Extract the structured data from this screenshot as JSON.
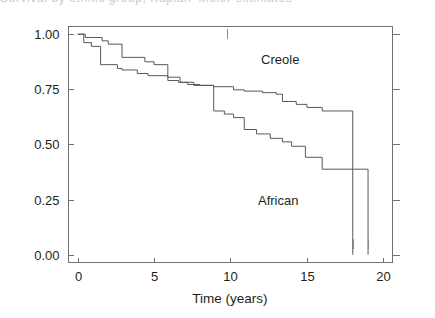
{
  "figure": {
    "width": 435,
    "height": 318,
    "background": "#ffffff",
    "clipped_caption_remnant": "Survival by ethnic group, Kaplan–Meier estimates"
  },
  "chart_data": {
    "type": "line",
    "subtype": "kaplan-meier-step",
    "title": "",
    "xlabel": "Time (years)",
    "ylabel": "",
    "xlim": [
      -0.6,
      20.6
    ],
    "ylim": [
      -0.035,
      1.035
    ],
    "xticks": [
      0,
      5,
      10,
      15,
      20
    ],
    "xtick_labels": [
      "0",
      "5",
      "10",
      "15",
      "20"
    ],
    "yticks": [
      0.0,
      0.25,
      0.5,
      0.75,
      1.0
    ],
    "ytick_labels": [
      "0.00",
      "0.25",
      "0.50",
      "0.75",
      "1.00"
    ],
    "grid": false,
    "legend_position": "inline-annotation",
    "line_color": "#58585b",
    "axis_color": "#6f6f72",
    "text_color": "#231f20",
    "annotations": [
      {
        "text": "Creole",
        "x": 12.0,
        "y": 0.865
      },
      {
        "text": "African",
        "x": 11.8,
        "y": 0.225
      }
    ],
    "series": [
      {
        "name": "Creole",
        "label": "Creole",
        "x": [
          0.0,
          0.5,
          0.5,
          1.6,
          1.6,
          2.0,
          2.0,
          2.9,
          2.9,
          4.4,
          4.4,
          5.0,
          5.0,
          5.9,
          5.9,
          6.6,
          6.6,
          7.2,
          7.2,
          8.0,
          8.0,
          8.9,
          8.9,
          10.2,
          10.2,
          10.9,
          10.9,
          12.1,
          12.1,
          13.0,
          13.0,
          13.4,
          13.4,
          14.3,
          14.3,
          15.0,
          15.0,
          16.0,
          16.0,
          18.0,
          18.0
        ],
        "y": [
          1.0,
          1.0,
          0.985,
          0.985,
          0.97,
          0.97,
          0.955,
          0.955,
          0.895,
          0.895,
          0.875,
          0.875,
          0.862,
          0.862,
          0.79,
          0.79,
          0.782,
          0.782,
          0.772,
          0.772,
          0.768,
          0.768,
          0.762,
          0.762,
          0.748,
          0.748,
          0.742,
          0.742,
          0.735,
          0.735,
          0.728,
          0.728,
          0.695,
          0.695,
          0.682,
          0.682,
          0.668,
          0.668,
          0.652,
          0.652,
          0.0
        ],
        "step_times": [
          0.5,
          1.6,
          2.0,
          2.9,
          4.4,
          5.0,
          5.9,
          6.6,
          7.2,
          8.0,
          8.9,
          10.2,
          10.9,
          12.1,
          13.0,
          13.4,
          14.3,
          15.0,
          16.0,
          18.0
        ],
        "step_values": [
          0.985,
          0.97,
          0.955,
          0.895,
          0.875,
          0.862,
          0.79,
          0.782,
          0.772,
          0.768,
          0.762,
          0.748,
          0.742,
          0.735,
          0.728,
          0.695,
          0.682,
          0.668,
          0.652,
          0.0
        ],
        "terminal_drop_time": 18.0,
        "terminal_plateau_value": 0.652
      },
      {
        "name": "African",
        "label": "African",
        "x": [
          0.0,
          0.4,
          0.4,
          0.9,
          0.9,
          1.5,
          1.5,
          2.6,
          2.6,
          2.9,
          2.9,
          3.9,
          3.9,
          4.6,
          4.6,
          5.9,
          5.9,
          6.7,
          6.7,
          7.6,
          7.6,
          8.9,
          8.9,
          9.6,
          9.6,
          10.2,
          10.2,
          10.9,
          10.9,
          11.7,
          11.7,
          12.6,
          12.6,
          13.4,
          13.4,
          14.0,
          14.0,
          14.9,
          14.9,
          16.0,
          16.0,
          19.0,
          19.0
        ],
        "y": [
          1.0,
          1.0,
          0.962,
          0.962,
          0.945,
          0.945,
          0.862,
          0.862,
          0.845,
          0.845,
          0.838,
          0.838,
          0.822,
          0.822,
          0.812,
          0.812,
          0.805,
          0.805,
          0.782,
          0.782,
          0.768,
          0.768,
          0.652,
          0.652,
          0.638,
          0.638,
          0.622,
          0.622,
          0.568,
          0.568,
          0.548,
          0.548,
          0.528,
          0.528,
          0.512,
          0.512,
          0.492,
          0.492,
          0.442,
          0.442,
          0.388,
          0.388,
          0.0
        ],
        "step_times": [
          0.4,
          0.9,
          1.5,
          2.6,
          2.9,
          3.9,
          4.6,
          5.9,
          6.7,
          7.6,
          8.9,
          9.6,
          10.2,
          10.9,
          11.7,
          12.6,
          13.4,
          14.0,
          14.9,
          16.0,
          19.0
        ],
        "step_values": [
          0.962,
          0.945,
          0.862,
          0.845,
          0.838,
          0.822,
          0.812,
          0.805,
          0.782,
          0.768,
          0.652,
          0.638,
          0.622,
          0.568,
          0.548,
          0.528,
          0.512,
          0.492,
          0.442,
          0.388,
          0.0
        ],
        "terminal_drop_time": 19.0,
        "terminal_plateau_value": 0.388
      }
    ],
    "censor_marks": [
      {
        "series": "Creole",
        "x": 9.8,
        "y": 1.0
      },
      {
        "series": "Creole",
        "x": 18.0,
        "y": 0.05
      },
      {
        "series": "African",
        "x": 19.0,
        "y": 0.05
      }
    ]
  }
}
